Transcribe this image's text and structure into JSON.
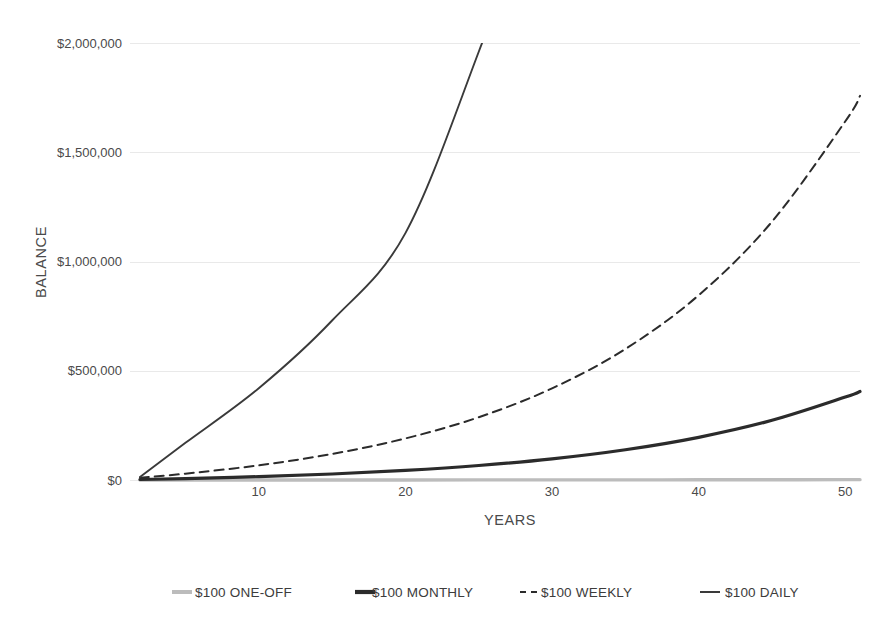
{
  "chart_data": {
    "type": "line",
    "title": "",
    "xlabel": "YEARS",
    "ylabel": "BALANCE",
    "xlim": [
      1.9,
      51
    ],
    "ylim": [
      0,
      2000000
    ],
    "grid": true,
    "legend_position": "bottom",
    "x_ticks": [
      10,
      20,
      30,
      40,
      50
    ],
    "x_tick_labels": [
      "10",
      "20",
      "30",
      "40",
      "50"
    ],
    "y_ticks": [
      0,
      500000,
      1000000,
      1500000,
      2000000
    ],
    "y_tick_labels": [
      "$0",
      "$500,000",
      "$1,000,000",
      "$1,500,000",
      "$2,000,000"
    ],
    "x": [
      1.9,
      5,
      10,
      15,
      20,
      25,
      30,
      35,
      40,
      45,
      50,
      51
    ],
    "series": [
      {
        "name": "$100 ONE-OFF",
        "style": "solid",
        "color": "#bcbcbc",
        "width": 3.4,
        "values": [
          100,
          120,
          160,
          210,
          280,
          370,
          490,
          650,
          860,
          1140,
          1510,
          1590
        ]
      },
      {
        "name": "$100 MONTHLY",
        "style": "solid",
        "color": "#2b2b2b",
        "width": 3.2,
        "values": [
          2400,
          6700,
          15500,
          27500,
          43900,
          66300,
          96800,
          138500,
          195400,
          273200,
          379500,
          405000
        ]
      },
      {
        "name": "$100 WEEKLY",
        "style": "dashed",
        "color": "#2b2b2b",
        "width": 2.0,
        "values": [
          10400,
          29000,
          67200,
          119200,
          190200,
          287200,
          419400,
          599700,
          845800,
          1182500,
          1641800,
          1758000
        ]
      },
      {
        "name": "$100 DAILY",
        "style": "solid",
        "color": "#3a3a3a",
        "width": 1.9,
        "values": [
          14000,
          170000,
          420000,
          730000,
          1130000,
          1960000,
          2900000,
          4200000,
          5900000,
          8300000,
          11500000,
          12300000
        ]
      }
    ],
    "annotations": {
      "daily_exits_top_at_year": 25.3,
      "weekly_end_value": 1560000,
      "monthly_end_value": 385000,
      "oneoff_end_value": 1500
    }
  },
  "legend": {
    "items": [
      {
        "label": "$100 ONE-OFF",
        "marker": "solid-thick-gray"
      },
      {
        "label": "$100 MONTHLY",
        "marker": "solid-thick-dark"
      },
      {
        "label": "$100 WEEKLY",
        "marker": "dashed-dark"
      },
      {
        "label": "$100 DAILY",
        "marker": "solid-thin-dark"
      }
    ]
  },
  "colors": {
    "background": "#ffffff",
    "gridline": "#e9e9e9",
    "text": "#4a4a4a",
    "one_off": "#bcbcbc",
    "monthly": "#2b2b2b",
    "weekly": "#2b2b2b",
    "daily": "#3a3a3a"
  }
}
